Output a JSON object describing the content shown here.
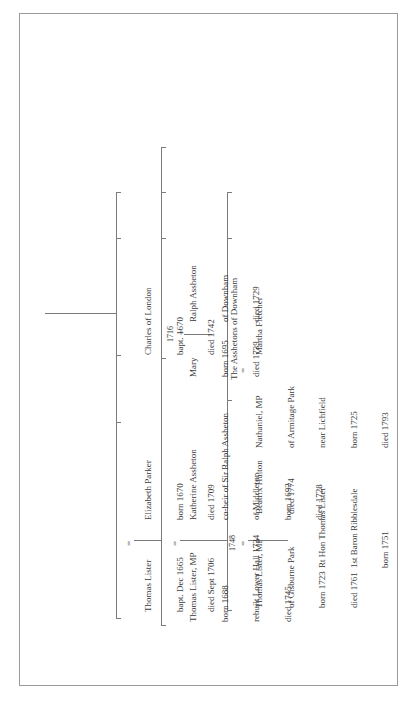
{
  "page": {
    "orientation": "rotated-90-ccw",
    "type": "family-tree"
  },
  "generations": [
    {
      "person": {
        "name": "Thomas Lister",
        "lines": [
          "bapt. Dec 1665",
          "died Sept 1706"
        ]
      },
      "spouse": {
        "name": "Elizabeth Parker",
        "lines": [
          "born 1670",
          "died 1709"
        ]
      },
      "marriage_symbol": "=",
      "siblings": [
        {
          "name": "Charles of London",
          "lines": [
            "bapt. 1670",
            "died 1742"
          ]
        }
      ]
    },
    {
      "person": {
        "name": "Thomas Lister, MP",
        "lines": [
          "born 1688",
          "rebuilt Lower Hall 1724",
          "died 1745"
        ]
      },
      "spouse": {
        "name": "Katherine Assheton",
        "lines": [
          "co-heir of Sir Ralph Assheton",
          "of Middleton",
          "born 1692",
          "died 1728"
        ]
      },
      "marriage_symbol": "=",
      "siblings": [
        {
          "name": "Mary",
          "lines": [
            "born 1695",
            "died 1739"
          ],
          "marriage_year": "1716",
          "marriage_symbol": "=",
          "spouse": {
            "name": "Ralph Assheton",
            "lines": [
              "of Downham",
              "died 1729"
            ]
          },
          "issue": "The Asshetons of Downham"
        }
      ]
    },
    {
      "person": {
        "name": "Thomas Lister, MP",
        "lines": [
          "of Gisburne Park",
          "born 1723",
          "died 1761"
        ]
      },
      "marriage_year": "1748",
      "marriage_symbol": "=",
      "spouse": {
        "name": "Beatrix Hulton",
        "lines": [
          "died 1774"
        ]
      },
      "siblings": [
        {
          "name": "Nathaniel, MP",
          "lines": [
            "of Armitage Park",
            "near Lichfield",
            "born 1725",
            "died 1793"
          ],
          "marriage_symbol": "=",
          "spouse": {
            "name": "Martha Fletcher",
            "lines": []
          }
        }
      ],
      "child": {
        "name": "Rt Hon Thomas Lister",
        "lines": [
          "1st Baron Ribblesdale",
          "born 1751"
        ]
      }
    }
  ]
}
